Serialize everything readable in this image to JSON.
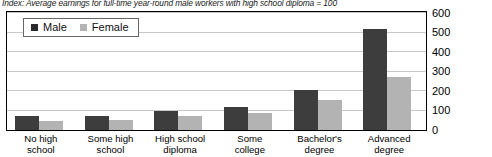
{
  "chart_data": {
    "type": "bar",
    "title": "",
    "subtitle": "Index: Average earnings for full-time year-round male workers with high school diploma = 100",
    "xlabel": "",
    "ylabel": "",
    "ylim": [
      0,
      600
    ],
    "yticks": [
      0,
      100,
      200,
      300,
      400,
      500,
      600
    ],
    "ytick_labels": [
      "0",
      "100",
      "200",
      "300",
      "400",
      "500",
      "600"
    ],
    "grid": true,
    "axis_position": "right",
    "legend_position": "top-left",
    "categories": [
      "No high school",
      "Some high school",
      "High school diploma",
      "Some college",
      "Bachelor's degree",
      "Advanced degree"
    ],
    "category_lines": [
      [
        "No high",
        "school"
      ],
      [
        "Some high",
        "school"
      ],
      [
        "High school",
        "diploma"
      ],
      [
        "Some",
        "college"
      ],
      [
        "Bachelor's",
        "degree"
      ],
      [
        "Advanced",
        "degree"
      ]
    ],
    "series": [
      {
        "name": "Male",
        "color": "#3d3d3d",
        "values": [
          70,
          72,
          100,
          120,
          205,
          520
        ]
      },
      {
        "name": "Female",
        "color": "#b3b3b3",
        "values": [
          45,
          52,
          72,
          88,
          152,
          272
        ]
      }
    ]
  },
  "legend": {
    "items": [
      {
        "label": "Male",
        "color": "#3d3d3d"
      },
      {
        "label": "Female",
        "color": "#b3b3b3"
      }
    ]
  }
}
